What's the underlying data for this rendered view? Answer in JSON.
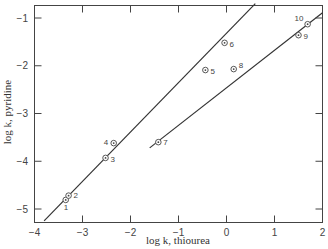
{
  "chart_data": {
    "type": "scatter",
    "title": "",
    "xlabel": "log k, thiourea",
    "ylabel": "log k, pyridine",
    "xlim": [
      -4,
      2
    ],
    "ylim": [
      -5.25,
      -0.7
    ],
    "xticks": [
      -4,
      -3,
      -2,
      -1,
      0,
      1,
      2
    ],
    "xtick_labels": [
      "−4",
      "−3",
      "−2",
      "−1",
      "0",
      "1",
      "2"
    ],
    "yticks": [
      -1,
      -2,
      -3,
      -4,
      -5
    ],
    "ytick_labels": [
      "−1",
      "−2",
      "−3",
      "−4",
      "−5"
    ],
    "grid": false,
    "legend": null,
    "points": [
      {
        "label": "1",
        "x": -3.35,
        "y": -4.81
      },
      {
        "label": "2",
        "x": -3.29,
        "y": -4.72
      },
      {
        "label": "3",
        "x": -2.52,
        "y": -3.93
      },
      {
        "label": "4",
        "x": -2.35,
        "y": -3.62
      },
      {
        "label": "5",
        "x": -0.44,
        "y": -2.09
      },
      {
        "label": "6",
        "x": -0.04,
        "y": -1.52
      },
      {
        "label": "7",
        "x": -1.42,
        "y": -3.6
      },
      {
        "label": "8",
        "x": 0.15,
        "y": -2.07
      },
      {
        "label": "9",
        "x": 1.5,
        "y": -1.36
      },
      {
        "label": "10",
        "x": 1.69,
        "y": -1.13
      }
    ],
    "lines": [
      {
        "name": "fit-line-upper",
        "x": [
          -3.8,
          0.6
        ],
        "y": [
          -5.25,
          -0.7
        ]
      },
      {
        "name": "fit-line-lower",
        "x": [
          -1.6,
          2.0
        ],
        "y": [
          -3.72,
          -0.89
        ]
      }
    ]
  }
}
